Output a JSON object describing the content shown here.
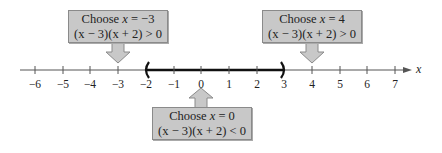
{
  "axis": {
    "variable": "x",
    "min": -6,
    "max": 7,
    "ticks": [
      "−6",
      "−5",
      "−4",
      "−3",
      "−2",
      "−1",
      "0",
      "1",
      "2",
      "3",
      "4",
      "5",
      "6",
      "7"
    ]
  },
  "interval": {
    "start": -2,
    "end": 3,
    "left_bracket": "(",
    "right_bracket": ")",
    "open_ends": true
  },
  "callouts": [
    {
      "id": "left",
      "test_value": "x = −3",
      "choose_prefix": "Choose ",
      "choose_var": "x",
      "choose_rest": " = −3",
      "expression": "(x − 3)(x + 2) > 0",
      "sign": ">",
      "points_to": -3,
      "direction": "down"
    },
    {
      "id": "right",
      "test_value": "x = 4",
      "choose_prefix": "Choose ",
      "choose_var": "x",
      "choose_rest": " = 4",
      "expression": "(x − 3)(x + 2) > 0",
      "sign": ">",
      "points_to": 4,
      "direction": "down"
    },
    {
      "id": "middle",
      "test_value": "x = 0",
      "choose_prefix": "Choose ",
      "choose_var": "x",
      "choose_rest": " = 0",
      "expression": "(x − 3)(x + 2) < 0",
      "sign": "<",
      "points_to": 0,
      "direction": "up"
    }
  ],
  "colors": {
    "box_fill": "#c8c8c8",
    "box_border": "#8a8a8a",
    "axis_line": "#555555",
    "interval_line": "#111111",
    "arrow_fill": "#c8c8c8"
  }
}
